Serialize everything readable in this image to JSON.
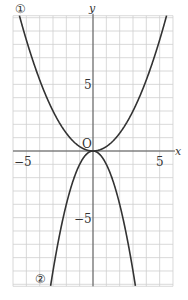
{
  "chart_data": {
    "type": "line",
    "title": "",
    "xlabel": "x",
    "ylabel": "y",
    "xlim": [
      -6,
      6
    ],
    "ylim": [
      -10,
      10
    ],
    "grid": true,
    "grid_step": 1,
    "origin_label": "O",
    "x_tick_labels": [
      {
        "value": -5,
        "label": "−5"
      },
      {
        "value": 5,
        "label": "5"
      }
    ],
    "y_tick_labels": [
      {
        "value": 5,
        "label": "5"
      },
      {
        "value": -5,
        "label": "−5"
      }
    ],
    "series": [
      {
        "name": "①",
        "equation": "y = x^2/3",
        "coef": 0.3333,
        "color": "#333333"
      },
      {
        "name": "②",
        "equation": "y = -x^2",
        "coef": -1,
        "color": "#333333"
      }
    ]
  },
  "labels": {
    "curve1": "①",
    "curve2": "②",
    "x_axis": "x",
    "y_axis": "y",
    "origin": "O",
    "xneg5": "−5",
    "xpos5": "5",
    "ypos5": "5",
    "yneg5": "−5"
  },
  "colors": {
    "grid": "#cfcfcf",
    "axis": "#555555",
    "curve": "#333333"
  }
}
